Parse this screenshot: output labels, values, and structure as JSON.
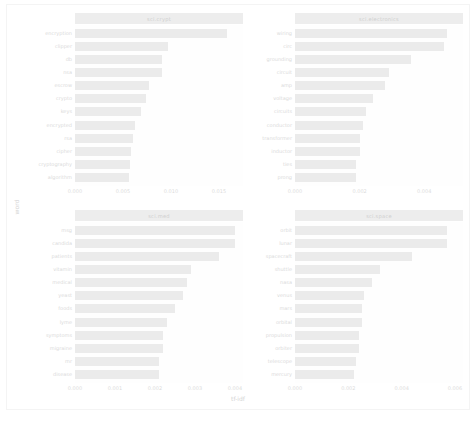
{
  "figure": {
    "axis_title_x": "tf-idf",
    "axis_title_y": "word",
    "caption": "",
    "bar_color": "#d5d5d5",
    "strip_color": "#d9d9d9",
    "background": "#ffffff"
  },
  "chart_data": {
    "type": "bar",
    "orientation": "horizontal",
    "title": "",
    "xlabel": "tf-idf",
    "ylabel": "word",
    "grid": false,
    "legend": "none",
    "facet_layout": "2x2",
    "facets": [
      {
        "name": "sci.crypt",
        "position": "top-left",
        "xlim": [
          0,
          0.0175
        ],
        "xticks": [
          0.0,
          0.005,
          0.01,
          0.015
        ],
        "xtick_labels": [
          "0.000",
          "0.005",
          "0.010",
          "0.015"
        ],
        "categories": [
          "encryption",
          "clipper",
          "db",
          "nsa",
          "escrow",
          "crypto",
          "keys",
          "encrypted",
          "rsa",
          "cipher",
          "cryptography",
          "algorithm"
        ],
        "values": [
          0.0158,
          0.0097,
          0.0091,
          0.0091,
          0.0077,
          0.0074,
          0.0069,
          0.0063,
          0.006,
          0.0058,
          0.0057,
          0.0056
        ]
      },
      {
        "name": "sci.electronics",
        "position": "top-right",
        "xlim": [
          0,
          0.0052
        ],
        "xticks": [
          0.0,
          0.002,
          0.004
        ],
        "xtick_labels": [
          "0.000",
          "0.002",
          "0.004"
        ],
        "categories": [
          "wiring",
          "circ",
          "grounding",
          "circuit",
          "amp",
          "voltage",
          "circuits",
          "conductor",
          "transformer",
          "inductor",
          "ties",
          "prong"
        ],
        "values": [
          0.0047,
          0.0046,
          0.0036,
          0.0029,
          0.0028,
          0.0024,
          0.0022,
          0.0021,
          0.002,
          0.002,
          0.0019,
          0.0019
        ]
      },
      {
        "name": "sci.med",
        "position": "bottom-left",
        "xlim": [
          0,
          0.0042
        ],
        "xticks": [
          0.0,
          0.001,
          0.002,
          0.003,
          0.004
        ],
        "xtick_labels": [
          "0.000",
          "0.001",
          "0.002",
          "0.003",
          "0.004"
        ],
        "categories": [
          "msg",
          "candida",
          "patients",
          "vitamin",
          "medical",
          "yeast",
          "foods",
          "lyme",
          "symptoms",
          "migraine",
          "mr",
          "disease"
        ],
        "values": [
          0.004,
          0.004,
          0.0036,
          0.0029,
          0.0028,
          0.0027,
          0.0025,
          0.0023,
          0.0022,
          0.0022,
          0.0021,
          0.0021
        ]
      },
      {
        "name": "sci.space",
        "position": "bottom-right",
        "xlim": [
          0,
          0.0063
        ],
        "xticks": [
          0.0,
          0.002,
          0.004,
          0.006
        ],
        "xtick_labels": [
          "0.000",
          "0.002",
          "0.004",
          "0.006"
        ],
        "categories": [
          "orbit",
          "lunar",
          "spacecraft",
          "shuttle",
          "nasa",
          "venus",
          "mars",
          "orbital",
          "propulsion",
          "orbiter",
          "telescope",
          "mercury"
        ],
        "values": [
          0.0057,
          0.0057,
          0.0044,
          0.0032,
          0.0029,
          0.0026,
          0.0025,
          0.0025,
          0.0024,
          0.0024,
          0.0023,
          0.0022
        ]
      }
    ]
  }
}
